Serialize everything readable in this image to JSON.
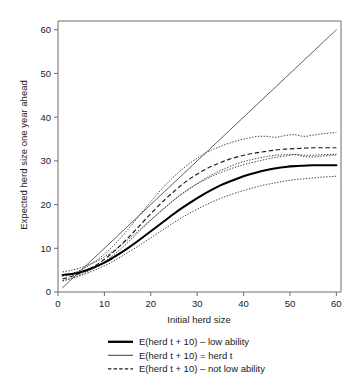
{
  "chart_data": {
    "type": "line",
    "title": "",
    "xlabel": "Initial herd size",
    "ylabel": "Expected herd size one year ahead",
    "xlim": [
      0,
      61
    ],
    "ylim": [
      0,
      62
    ],
    "xticks": [
      0,
      10,
      20,
      30,
      40,
      50,
      60
    ],
    "yticks": [
      0,
      10,
      20,
      30,
      40,
      50,
      60
    ],
    "grid": false,
    "legend_position": "below-axes",
    "x": [
      1,
      3,
      5,
      7,
      9,
      11,
      13,
      15,
      17,
      19,
      21,
      23,
      25,
      27,
      29,
      31,
      33,
      35,
      37,
      39,
      41,
      43,
      45,
      47,
      49,
      51,
      53,
      55,
      57,
      59,
      60
    ],
    "series": [
      {
        "name": "E(herd t + 10) - low ability",
        "style": "solid-thick",
        "role": "estimate",
        "values": [
          3.9,
          4.1,
          4.6,
          5.3,
          6.2,
          7.3,
          8.6,
          10.0,
          11.5,
          13.1,
          14.7,
          16.3,
          17.9,
          19.4,
          20.8,
          22.1,
          23.3,
          24.4,
          25.3,
          26.1,
          26.8,
          27.4,
          27.9,
          28.3,
          28.6,
          28.8,
          28.9,
          29.0,
          29.0,
          29.0,
          29.0
        ]
      },
      {
        "name": "E(herd t + 10) - low ability lower CI",
        "style": "dotted",
        "role": "confidence-band",
        "values": [
          2.6,
          3.1,
          3.8,
          4.6,
          5.5,
          6.5,
          7.7,
          9.0,
          10.3,
          11.7,
          13.1,
          14.5,
          15.9,
          17.2,
          18.4,
          19.5,
          20.5,
          21.4,
          22.2,
          22.9,
          23.5,
          24.1,
          24.6,
          25.0,
          25.4,
          25.7,
          25.9,
          26.1,
          26.3,
          26.4,
          26.5
        ]
      },
      {
        "name": "E(herd t + 10) - low ability upper CI",
        "style": "dotted",
        "role": "confidence-band",
        "values": [
          4.6,
          5.0,
          5.6,
          6.4,
          7.4,
          8.7,
          10.2,
          11.9,
          13.7,
          15.6,
          17.4,
          19.2,
          21.0,
          22.6,
          24.1,
          25.5,
          26.7,
          27.8,
          28.7,
          29.5,
          30.1,
          30.6,
          31.0,
          31.3,
          31.4,
          31.5,
          31.3,
          31.3,
          31.4,
          31.5,
          31.5
        ]
      },
      {
        "name": "E(herd t + 10) = herd t",
        "style": "solid-thin",
        "role": "identity",
        "values": [
          1,
          3,
          5,
          7,
          9,
          11,
          13,
          15,
          17,
          19,
          21,
          23,
          25,
          27,
          29,
          31,
          33,
          35,
          37,
          39,
          41,
          43,
          45,
          47,
          49,
          51,
          53,
          55,
          57,
          59,
          60
        ]
      },
      {
        "name": "E(herd t + 10) - not low ability",
        "style": "dashed",
        "role": "estimate",
        "values": [
          3.0,
          3.6,
          4.4,
          5.4,
          6.7,
          8.3,
          10.2,
          12.3,
          14.5,
          16.8,
          19.0,
          21.1,
          23.0,
          24.8,
          26.3,
          27.6,
          28.7,
          29.6,
          30.4,
          31.0,
          31.5,
          31.9,
          32.2,
          32.5,
          32.7,
          32.8,
          32.9,
          33.0,
          33.0,
          33.0,
          33.0
        ]
      },
      {
        "name": "E(herd t + 10) - not low ability lower CI",
        "style": "dotted",
        "role": "confidence-band",
        "values": [
          2.5,
          3.2,
          4.0,
          5.0,
          6.2,
          7.7,
          9.4,
          11.3,
          13.3,
          15.4,
          17.4,
          19.3,
          21.1,
          22.7,
          24.1,
          25.3,
          26.4,
          27.3,
          28.1,
          28.8,
          29.4,
          29.9,
          30.4,
          30.8,
          31.1,
          31.4,
          31.0,
          30.9,
          31.1,
          31.3,
          31.4
        ]
      },
      {
        "name": "E(herd t + 10) - not low ability upper CI",
        "style": "dotted",
        "role": "confidence-band",
        "values": [
          3.6,
          4.2,
          5.1,
          6.3,
          7.8,
          9.6,
          11.8,
          14.2,
          16.8,
          19.4,
          21.9,
          24.3,
          26.4,
          28.3,
          29.9,
          31.3,
          32.4,
          33.3,
          34.1,
          34.7,
          35.2,
          35.6,
          35.6,
          35.4,
          35.8,
          36.0,
          35.6,
          35.9,
          36.2,
          36.4,
          36.5
        ]
      }
    ],
    "legend": [
      {
        "label": "E(herd t + 10) – low ability",
        "style": "solid-thick"
      },
      {
        "label": "E(herd t + 10) = herd t",
        "style": "solid-thin"
      },
      {
        "label": "E(herd t + 10) – not low ability",
        "style": "dashed"
      }
    ]
  },
  "caption": {
    "text": ""
  }
}
